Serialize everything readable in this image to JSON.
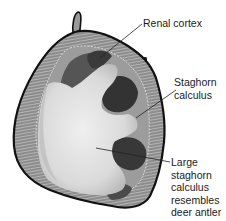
{
  "figure": {
    "labels": {
      "renal_cortex": "Renal cortex",
      "staghorn_calculus": [
        "Staghorn",
        "calculus"
      ],
      "large_staghorn": [
        "Large",
        "staghorn",
        "calculus",
        "resembles",
        "deer antler"
      ]
    },
    "colors": {
      "outline": "#111111",
      "cortex": "#8a8a8a",
      "cortex_stripe": "#c8c8c8",
      "calyx_dark": "#3a3a3a",
      "calyx_mid": "#5a5a5a",
      "stone": "#e2e2e2",
      "stone_shadow": "#bdbdbd",
      "leader_line": "#222222"
    }
  }
}
